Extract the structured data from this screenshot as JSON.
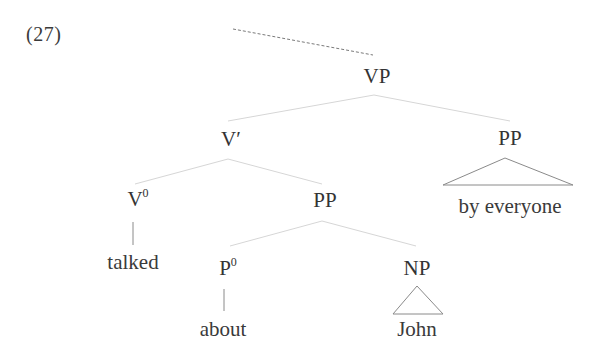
{
  "example": {
    "number": "(27)"
  },
  "tree": {
    "nodes": {
      "vp": {
        "label": "VP"
      },
      "v_bar": {
        "label": "V",
        "prime": "′"
      },
      "pp_upper": {
        "label": "PP"
      },
      "v0": {
        "label": "V",
        "sup": "0"
      },
      "pp_lower": {
        "label": "PP"
      },
      "p0": {
        "label": "P",
        "sup": "0"
      },
      "np": {
        "label": "NP"
      }
    },
    "leaves": {
      "talked": "talked",
      "about": "about",
      "john": "John",
      "by_everyone": "by everyone"
    },
    "colors": {
      "branch_line": "#d6d6d6",
      "terminal_line": "#8a8a8a",
      "triangle_line": "#8a8a8a",
      "dotted_line": "#7a7a7a"
    }
  }
}
